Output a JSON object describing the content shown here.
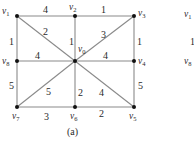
{
  "figure": {
    "caption": "(a)",
    "graph": {
      "nodes": [
        {
          "id": "v1",
          "base": "v",
          "sub": "1",
          "x": 17,
          "y": 16
        },
        {
          "id": "v2",
          "base": "v",
          "sub": "2",
          "x": 75,
          "y": 16
        },
        {
          "id": "v3",
          "base": "v",
          "sub": "3",
          "x": 134,
          "y": 16
        },
        {
          "id": "v8",
          "base": "v",
          "sub": "8",
          "x": 17,
          "y": 61
        },
        {
          "id": "v0",
          "base": "v",
          "sub": "0",
          "x": 75,
          "y": 61
        },
        {
          "id": "v4",
          "base": "v",
          "sub": "4",
          "x": 134,
          "y": 61
        },
        {
          "id": "v7",
          "base": "v",
          "sub": "7",
          "x": 17,
          "y": 107
        },
        {
          "id": "v6",
          "base": "v",
          "sub": "6",
          "x": 75,
          "y": 107
        },
        {
          "id": "v5",
          "base": "v",
          "sub": "5",
          "x": 134,
          "y": 107
        }
      ],
      "edges": [
        {
          "from": "v1",
          "to": "v2",
          "weight": "4"
        },
        {
          "from": "v2",
          "to": "v3",
          "weight": "1"
        },
        {
          "from": "v1",
          "to": "v8",
          "weight": "1"
        },
        {
          "from": "v3",
          "to": "v4",
          "weight": "1"
        },
        {
          "from": "v1",
          "to": "v0",
          "weight": "2"
        },
        {
          "from": "v2",
          "to": "v0",
          "weight": "1"
        },
        {
          "from": "v3",
          "to": "v0",
          "weight": "3"
        },
        {
          "from": "v8",
          "to": "v0",
          "weight": "4"
        },
        {
          "from": "v0",
          "to": "v4",
          "weight": "4"
        },
        {
          "from": "v8",
          "to": "v7",
          "weight": "5"
        },
        {
          "from": "v4",
          "to": "v5",
          "weight": "5"
        },
        {
          "from": "v7",
          "to": "v0",
          "weight": "5"
        },
        {
          "from": "v0",
          "to": "v6",
          "weight": "2"
        },
        {
          "from": "v0",
          "to": "v5",
          "weight": "4"
        },
        {
          "from": "v7",
          "to": "v6",
          "weight": "3"
        },
        {
          "from": "v6",
          "to": "v5",
          "weight": "2"
        }
      ]
    },
    "cropped_graph_b": {
      "labels": [
        {
          "base": "v",
          "sub": "1"
        },
        {
          "text": "1"
        },
        {
          "base": "v",
          "sub": "8"
        }
      ]
    }
  }
}
